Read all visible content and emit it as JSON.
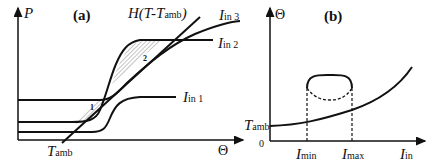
{
  "panel_a": {
    "label": "(a)",
    "y_axis": "P",
    "x_axis": "Θ",
    "line_label": {
      "main": "H(T-T",
      "sub": "amb",
      "close": ")"
    },
    "x_tick": {
      "main": "T",
      "sub": "amb"
    },
    "curves": [
      {
        "main": "I",
        "sub": "in 1"
      },
      {
        "main": "I",
        "sub": "in 2"
      },
      {
        "main": "I",
        "sub": "in 3"
      }
    ],
    "regions": [
      "1",
      "2"
    ]
  },
  "panel_b": {
    "label": "(b)",
    "y_axis": "Θ",
    "origin": "0",
    "y_tick": {
      "main": "T",
      "sub": "amb"
    },
    "x_ticks": [
      {
        "main": "I",
        "sub": "min"
      },
      {
        "main": "I",
        "sub": "max"
      }
    ],
    "x_axis": {
      "main": "I",
      "sub": "in"
    }
  },
  "colors": {
    "stroke": "#111111",
    "hatch": "#999999",
    "background": "#ffffff"
  }
}
